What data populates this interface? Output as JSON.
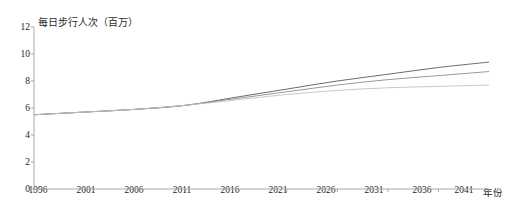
{
  "chart_data": {
    "type": "line",
    "title": "",
    "ylabel": "每日步行人次（百万）",
    "xlabel": "年份",
    "ylim": [
      0,
      12
    ],
    "yticks": [
      0,
      2,
      4,
      6,
      8,
      10,
      12
    ],
    "xlim": [
      1996,
      2041
    ],
    "xticks": [
      1996,
      2001,
      2006,
      2011,
      2016,
      2021,
      2026,
      2031,
      2036,
      2041
    ],
    "grid": false,
    "legend": "none",
    "x": [
      1996,
      2001,
      2006,
      2011,
      2016,
      2021,
      2026,
      2031,
      2036,
      2041
    ],
    "series": [
      {
        "name": "high",
        "color": "#5a5a5a",
        "values": [
          5.5,
          5.7,
          5.9,
          6.2,
          6.8,
          7.4,
          8.0,
          8.5,
          9.0,
          9.4
        ]
      },
      {
        "name": "medium",
        "color": "#8c8c8c",
        "values": [
          5.5,
          5.7,
          5.9,
          6.2,
          6.7,
          7.2,
          7.7,
          8.1,
          8.4,
          8.7
        ]
      },
      {
        "name": "low",
        "color": "#c2c2c2",
        "values": [
          5.5,
          5.7,
          5.9,
          6.2,
          6.6,
          7.0,
          7.3,
          7.5,
          7.6,
          7.7
        ]
      }
    ]
  },
  "axes": {
    "y_title": "每日步行人次（百万）",
    "x_title": "年份",
    "y_tick_labels": [
      "12",
      "10",
      "8",
      "6",
      "4",
      "2",
      "0"
    ],
    "x_tick_labels": [
      "1996",
      "2001",
      "2006",
      "2011",
      "2016",
      "2021",
      "2026",
      "2031",
      "2036",
      "2041"
    ]
  },
  "colors": {
    "axis": "#a9a9a9",
    "text": "#222222",
    "line_high": "#5a5a5a",
    "line_medium": "#8c8c8c",
    "line_low": "#c2c2c2"
  }
}
